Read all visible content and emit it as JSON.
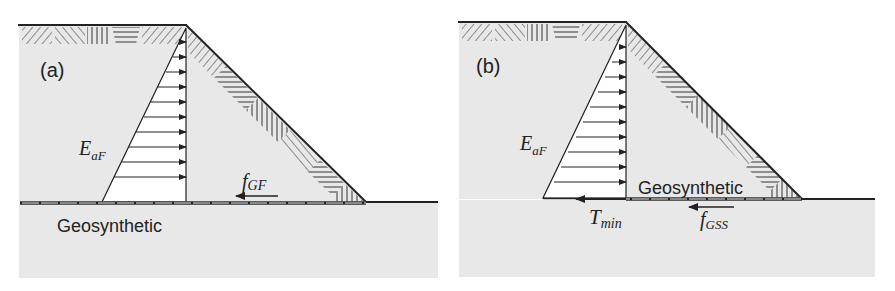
{
  "colors": {
    "soil": "#e8e8e8",
    "line": "#222222",
    "triangle_fill": "#ffffff",
    "background": "#ffffff"
  },
  "panels": [
    {
      "id": "a",
      "label": "(a)",
      "earth_pressure": {
        "main": "E",
        "sub": "aF"
      },
      "friction_force": {
        "main": "f",
        "sub": "GF"
      },
      "geosynthetic_label": "Geosynthetic",
      "arrow_count": 10
    },
    {
      "id": "b",
      "label": "(b)",
      "earth_pressure": {
        "main": "E",
        "sub": "aF"
      },
      "tension_force": {
        "main": "T",
        "sub": "min"
      },
      "friction_force": {
        "main": "f",
        "sub": "GSS"
      },
      "geosynthetic_label": "Geosynthetic",
      "arrow_count": 10
    }
  ]
}
